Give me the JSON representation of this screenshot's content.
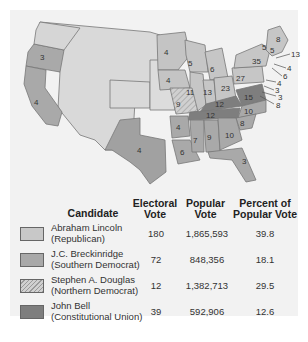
{
  "colors": {
    "lincoln": "#c8c8c8",
    "breckinridge": "#a8a8a8",
    "douglas": "#bdbdbd",
    "bell": "#7e7e7e",
    "territory": "#dcdcdc",
    "background": "#f2f2f2"
  },
  "map": {
    "state_labels": [
      {
        "id": "oregon",
        "value": "3"
      },
      {
        "id": "california",
        "value": "4"
      },
      {
        "id": "texas",
        "value": "4"
      },
      {
        "id": "minnesota",
        "value": "4"
      },
      {
        "id": "wisconsin",
        "value": "5"
      },
      {
        "id": "michigan",
        "value": "6"
      },
      {
        "id": "iowa",
        "value": "4"
      },
      {
        "id": "illinois",
        "value": "11"
      },
      {
        "id": "indiana",
        "value": "13"
      },
      {
        "id": "ohio",
        "value": "23"
      },
      {
        "id": "pennsylvania",
        "value": "27"
      },
      {
        "id": "new-york",
        "value": "35"
      },
      {
        "id": "vermont",
        "value": "5"
      },
      {
        "id": "new-hampshire",
        "value": "5"
      },
      {
        "id": "maine",
        "value": "8"
      },
      {
        "id": "massachusetts",
        "value": "13"
      },
      {
        "id": "rhode-island",
        "value": "4"
      },
      {
        "id": "connecticut",
        "value": "6"
      },
      {
        "id": "new-jersey",
        "value": "4"
      },
      {
        "id": "delaware",
        "value": "3"
      },
      {
        "id": "maryland",
        "value": "8"
      },
      {
        "id": "maryland-dc",
        "value": "3"
      },
      {
        "id": "missouri",
        "value": "9"
      },
      {
        "id": "kentucky",
        "value": "12"
      },
      {
        "id": "virginia",
        "value": "15"
      },
      {
        "id": "tennessee",
        "value": "12"
      },
      {
        "id": "north-carolina",
        "value": "10"
      },
      {
        "id": "south-carolina",
        "value": "8"
      },
      {
        "id": "arkansas",
        "value": "4"
      },
      {
        "id": "louisiana",
        "value": "6"
      },
      {
        "id": "mississippi",
        "value": "7"
      },
      {
        "id": "alabama",
        "value": "9"
      },
      {
        "id": "georgia",
        "value": "10"
      },
      {
        "id": "florida",
        "value": "3"
      }
    ]
  },
  "legend": {
    "headers": {
      "candidate": "Candidate",
      "electoral_1": "Electoral",
      "electoral_2": "Vote",
      "popular_1": "Popular",
      "popular_2": "Vote",
      "percent_1": "Percent of",
      "percent_2": "Popular Vote"
    },
    "rows": [
      {
        "name": "Abraham Lincoln",
        "party": "(Republican)",
        "electoral": "180",
        "popular": "1,865,593",
        "percent": "39.8"
      },
      {
        "name": "J.C. Breckinridge",
        "party": "(Southern Democrat)",
        "electoral": "72",
        "popular": "848,356",
        "percent": "18.1"
      },
      {
        "name": "Stephen A. Douglas",
        "party": "(Northern Democrat)",
        "electoral": "12",
        "popular": "1,382,713",
        "percent": "29.5"
      },
      {
        "name": "John Bell",
        "party": "(Constitutional Union)",
        "electoral": "39",
        "popular": "592,906",
        "percent": "12.6"
      }
    ]
  }
}
